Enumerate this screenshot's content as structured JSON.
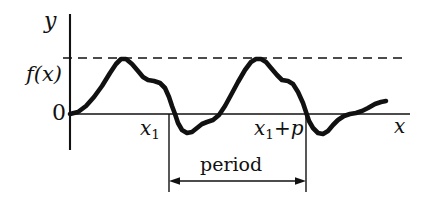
{
  "figure": {
    "colors": {
      "ink": "#111111",
      "curve": "#111111",
      "axis": "#111111",
      "dashed": "#111111",
      "background": "#ffffff"
    },
    "axes": {
      "y_label": "y",
      "x_label": "x",
      "origin_label": "0",
      "function_label": "f(x)",
      "y_axis_x_px": 70,
      "x_axis_y_px": 114,
      "y_axis_top_px": 14,
      "y_axis_bottom_px": 150,
      "x_axis_left_px": 70,
      "x_axis_right_px": 410
    },
    "dashed_line": {
      "name": "amplitude-guide-line",
      "y_px": 58,
      "x_start_px": 63,
      "x_end_px": 406,
      "dash_pattern": "9 6"
    },
    "markers": [
      {
        "name": "x1-marker",
        "label": "x",
        "subscript": "1",
        "x_px": 169
      },
      {
        "name": "x1-plus-p-marker",
        "label": "x",
        "subscript": "1",
        "suffix": "+p",
        "x_px": 306
      }
    ],
    "period_annotation": {
      "label": "period",
      "arrow_y_px": 181,
      "x_start_px": 169,
      "x_end_px": 306,
      "drop_line_bottom_px": 192
    }
  },
  "chart_data": {
    "type": "line",
    "title": "",
    "subtitle": "",
    "xlabel": "x",
    "ylabel": "y",
    "legend": [],
    "grid": false,
    "annotations": [
      "f(x)",
      "0",
      "x₁",
      "x₁+p",
      "period"
    ],
    "axis_ranges": {
      "xlim_px": [
        70,
        410
      ],
      "ylim_px": [
        14,
        150
      ],
      "zero_y_px": 114,
      "peak_y_px": 58
    },
    "series": [
      {
        "name": "f(x)",
        "points_px": [
          [
            70,
            114
          ],
          [
            78,
            112
          ],
          [
            86,
            106
          ],
          [
            94,
            97
          ],
          [
            102,
            86
          ],
          [
            110,
            73
          ],
          [
            116,
            64
          ],
          [
            121,
            59
          ],
          [
            126,
            59
          ],
          [
            132,
            64
          ],
          [
            138,
            71
          ],
          [
            143,
            77
          ],
          [
            148,
            80
          ],
          [
            154,
            81
          ],
          [
            160,
            83
          ],
          [
            165,
            88
          ],
          [
            169,
            97
          ],
          [
            172,
            106
          ],
          [
            175,
            114
          ],
          [
            178,
            123
          ],
          [
            182,
            130
          ],
          [
            187,
            133
          ],
          [
            192,
            132
          ],
          [
            197,
            128
          ],
          [
            202,
            124
          ],
          [
            207,
            122
          ],
          [
            213,
            120
          ],
          [
            219,
            115
          ],
          [
            225,
            106
          ],
          [
            231,
            95
          ],
          [
            238,
            82
          ],
          [
            245,
            70
          ],
          [
            251,
            62
          ],
          [
            256,
            59
          ],
          [
            261,
            59
          ],
          [
            266,
            62
          ],
          [
            271,
            68
          ],
          [
            277,
            75
          ],
          [
            282,
            80
          ],
          [
            288,
            81
          ],
          [
            293,
            84
          ],
          [
            298,
            92
          ],
          [
            303,
            103
          ],
          [
            306,
            112
          ],
          [
            309,
            121
          ],
          [
            313,
            128
          ],
          [
            318,
            133
          ],
          [
            323,
            134
          ],
          [
            328,
            131
          ],
          [
            333,
            125
          ],
          [
            338,
            120
          ],
          [
            344,
            116
          ],
          [
            350,
            114
          ],
          [
            356,
            113
          ],
          [
            362,
            111
          ],
          [
            368,
            108
          ],
          [
            375,
            104
          ],
          [
            381,
            102
          ],
          [
            386,
            101
          ]
        ]
      }
    ]
  }
}
